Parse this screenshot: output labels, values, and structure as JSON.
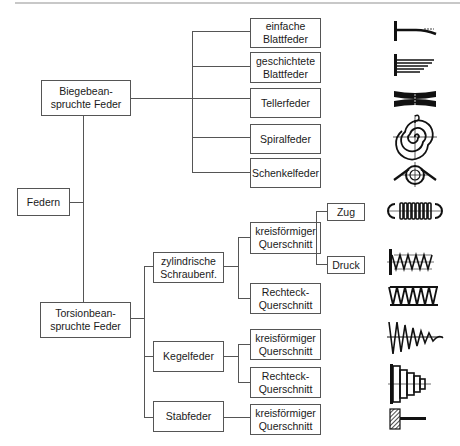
{
  "diagram": {
    "root": {
      "label": "Federn"
    },
    "categories": [
      {
        "label": "Biegebean-\nspruchte Feder",
        "children": [
          {
            "label": "einfache\nBlattfeder",
            "icon": "leaf-spring-simple-icon"
          },
          {
            "label": "geschichtete\nBlattfeder",
            "icon": "leaf-spring-layered-icon"
          },
          {
            "label": "Tellerfeder",
            "icon": "disc-spring-icon"
          },
          {
            "label": "Spiralfeder",
            "icon": "spiral-spring-icon"
          },
          {
            "label": "Schenkelfeder",
            "icon": "torsion-leg-spring-icon"
          }
        ]
      },
      {
        "label": "Torsionbean-\nspruchte Feder",
        "children": [
          {
            "label": "zylindrische\nSchraubenf.",
            "children": [
              {
                "label": "kreisförmiger\nQuerschnitt",
                "children": [
                  {
                    "label": "Zug",
                    "icon": "tension-spring-icon"
                  },
                  {
                    "label": "Druck",
                    "icon": "compression-spring-icon"
                  }
                ]
              },
              {
                "label": "Rechteck-\nQuerschnitt",
                "icon": "rectangular-coil-spring-icon"
              }
            ]
          },
          {
            "label": "Kegelfeder",
            "children": [
              {
                "label": "kreisförmiger\nQuerschnitt",
                "icon": "conical-spring-round-icon"
              },
              {
                "label": "Rechteck-\nQuerschnitt",
                "icon": "conical-spring-rect-icon"
              }
            ]
          },
          {
            "label": "Stabfeder",
            "children": [
              {
                "label": "kreisförmiger\nQuerschnitt",
                "icon": "torsion-bar-icon"
              }
            ]
          }
        ]
      }
    ]
  },
  "colors": {
    "line": "#555555",
    "text": "#1a1a1a",
    "icon": "#111111",
    "background": "#ffffff"
  }
}
